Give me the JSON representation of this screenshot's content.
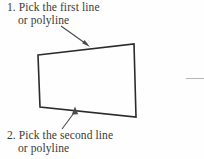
{
  "figure": {
    "background_color": "#fefefe",
    "ink_color": "#2b2b2b",
    "text_color": "#3a3a3a",
    "faint_rule_color": "#b9b9b9",
    "callouts": [
      {
        "id": "first-line",
        "line_1": "1. Pick the first line",
        "line_2": "or polyline",
        "arrow": {
          "name": "arrow-to-top-edge",
          "from_x": 61,
          "from_y": 26,
          "to_x": 90,
          "to_y": 47,
          "direction": "down-right"
        }
      },
      {
        "id": "second-line",
        "line_1": "2. Pick the second line",
        "line_2": "or polyline",
        "arrow": {
          "name": "arrow-to-bottom-edge",
          "from_x": 62,
          "from_y": 129,
          "to_x": 75,
          "to_y": 107,
          "direction": "up-right"
        }
      }
    ],
    "shape": {
      "name": "quadrilateral-outline",
      "type": "trapezoid",
      "points": [
        {
          "label": "top-left",
          "x": 38,
          "y": 55
        },
        {
          "label": "top-right",
          "x": 134,
          "y": 44
        },
        {
          "label": "bottom-right",
          "x": 136,
          "y": 117
        },
        {
          "label": "bottom-left",
          "x": 40,
          "y": 107
        }
      ],
      "stroke_width": 1.6,
      "fill": "none"
    },
    "faint_rule": {
      "name": "page-edge-rule",
      "x1": 186,
      "y1": 78.5,
      "x2": 204,
      "y2": 78.5
    }
  }
}
